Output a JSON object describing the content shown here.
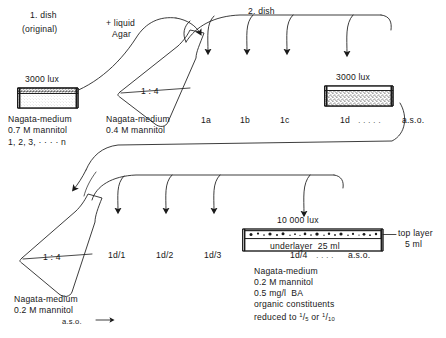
{
  "diagram": {
    "title_top_left": "1. dish",
    "subtitle_top_left": "(original)",
    "stage2_title": "2. dish",
    "additive_label_line1": "+ liquid",
    "additive_label_line2": "Agar"
  },
  "dish1": {
    "lux": "3000 lux",
    "medium": "Nagata-medium",
    "mannitol": "0.7 M mannitol",
    "series": "1, 2, 3, · · · · n"
  },
  "flask1": {
    "ratio": "1 : 4",
    "medium": "Nagata-medium",
    "mannitol": "0.4 M mannitol"
  },
  "row1": {
    "items": [
      "1a",
      "1b",
      "1c",
      "1d"
    ],
    "dots": "· · · · ·",
    "aso": "a.s.o.",
    "lux": "3000 lux"
  },
  "flask2": {
    "ratio": "1 : 4",
    "medium": "Nagata-medium",
    "mannitol": "0.2 M mannitol",
    "aso": "a.s.o."
  },
  "row2": {
    "items": [
      "1d/1",
      "1d/2",
      "1d/3",
      "1d/4"
    ],
    "dots": "· · · ·",
    "aso": "a.s.o.",
    "lux": "10 000 lux"
  },
  "final_dish": {
    "underlayer": "underlayer  25 ml",
    "top_layer_line1": "top layer",
    "top_layer_line2": "5 ml",
    "notes": [
      "Nagata-medium",
      "0.2 M mannitol",
      "0.5 mg/l  BA",
      "organic constituents"
    ],
    "reduced_prefix": "reduced to ",
    "reduced_frac1_num": "1",
    "reduced_frac1_den": "5",
    "reduced_mid": " or ",
    "reduced_frac2_num": "1",
    "reduced_frac2_den": "10"
  },
  "colors": {
    "ink": "#1a1a1a",
    "stipple": "#9a9a9a",
    "background": "#ffffff"
  }
}
